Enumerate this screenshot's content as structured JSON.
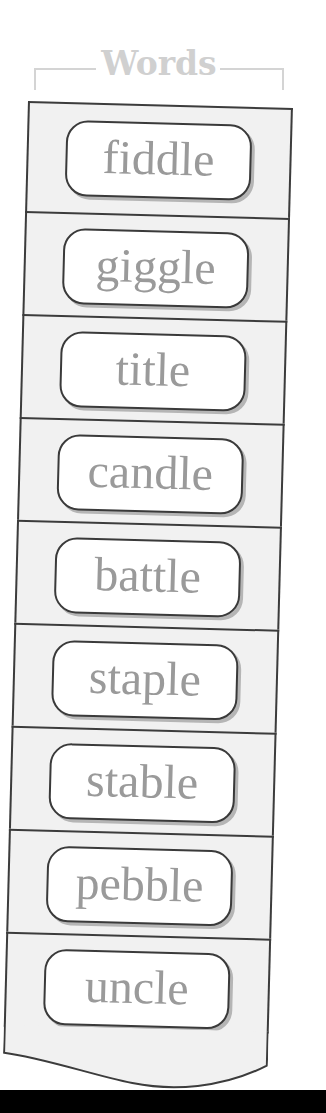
{
  "header": {
    "title": "Words"
  },
  "words": [
    {
      "label": "fiddle"
    },
    {
      "label": "giggle"
    },
    {
      "label": "title"
    },
    {
      "label": "candle"
    },
    {
      "label": "battle"
    },
    {
      "label": "staple"
    },
    {
      "label": "stable"
    },
    {
      "label": "pebble"
    },
    {
      "label": "uncle"
    }
  ],
  "colors": {
    "header_text": "#d0d0d0",
    "panel_bg": "#f1f1f1",
    "border": "#3c3c3c",
    "word_text": "#9a9a9a",
    "pill_bg": "#ffffff"
  }
}
